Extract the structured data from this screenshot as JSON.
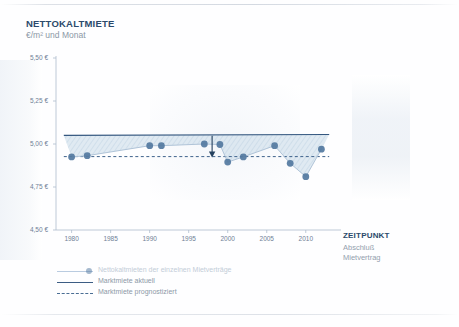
{
  "header": {
    "title": "NETTOKALTMIETE",
    "subtitle": "€/m² und Monat"
  },
  "right_axis": {
    "title": "ZEITPUNKT",
    "line1": "Abschluß",
    "line2": "Mietvertrag"
  },
  "legend": {
    "items": [
      {
        "label": "Nettokaltmieten der einzelnen Mietverträge",
        "style": "line-marker",
        "color": "#b9cbe0"
      },
      {
        "label": "Marktmiete aktuell",
        "style": "solid",
        "color": "#3c5d84"
      },
      {
        "label": "Marktmiete prognostiziert",
        "style": "dashed",
        "color": "#4a6d94"
      }
    ]
  },
  "colors": {
    "accent": "#2b4a6b",
    "marker": "#5b7fa6",
    "axis": "#aebccd",
    "tick_text": "#6f8096",
    "band_fill": "#ccdbe8",
    "hatch": "#b6cadc"
  },
  "caption": "",
  "chart_data": {
    "type": "line",
    "title": "NETTOKALTMIETE",
    "subtitle": "€/m² und Monat",
    "xlabel": "ZEITPUNKT Abschluß Mietvertrag",
    "ylabel": "€/m² und Monat",
    "xlim": [
      1978,
      2014
    ],
    "ylim": [
      4.5,
      5.5
    ],
    "grid": false,
    "legend_position": "bottom-left",
    "y_ticks": [
      4.5,
      4.75,
      5.0,
      5.25,
      5.5
    ],
    "y_tick_labels": [
      "4,50 €",
      "4,75 €",
      "5,00 €",
      "5,25 €",
      "5,50 €"
    ],
    "x_ticks": [
      1980,
      1985,
      1990,
      1995,
      2000,
      2005,
      2010
    ],
    "x_tick_labels": [
      "1980",
      "1985",
      "1990",
      "1995",
      "2000",
      "2005",
      "2010"
    ],
    "series": [
      {
        "name": "Nettokaltmieten der einzelnen Mietverträge",
        "type": "scatter-line",
        "x": [
          1980,
          1982,
          1990,
          1991.5,
          1997,
          1999,
          2000,
          2002,
          2006,
          2008,
          2010,
          2012
        ],
        "values": [
          4.925,
          4.932,
          4.99,
          4.99,
          5.0,
          4.997,
          4.895,
          4.925,
          4.99,
          4.888,
          4.81,
          4.97
        ]
      },
      {
        "name": "Marktmiete aktuell",
        "type": "line",
        "x": [
          1979,
          2013
        ],
        "values": [
          5.05,
          5.055
        ]
      },
      {
        "name": "Marktmiete prognostiziert",
        "type": "dashed-line",
        "x": [
          1979,
          2013
        ],
        "values": [
          4.927,
          4.927
        ]
      }
    ],
    "annotations": [
      {
        "type": "arrow",
        "x": 1998,
        "y_from": 5.048,
        "y_to": 4.928,
        "label": ""
      }
    ]
  }
}
